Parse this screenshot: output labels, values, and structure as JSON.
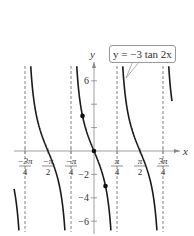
{
  "chart_data": {
    "type": "line",
    "title": "",
    "equation_label": "y = −3 tan 2x",
    "xlabel": "x",
    "ylabel": "y",
    "xlim": [
      -0.88,
      0.93
    ],
    "ylim": [
      -7.2,
      7.2
    ],
    "x_tick_labels": [
      {
        "num": "−3π",
        "den": "4",
        "value": -0.75
      },
      {
        "num": "−π",
        "den": "2",
        "value": -0.5
      },
      {
        "num": "−π",
        "den": "4",
        "value": -0.25
      },
      {
        "num": "π",
        "den": "4",
        "value": 0.25
      },
      {
        "num": "π",
        "den": "2",
        "value": 0.5
      },
      {
        "num": "3π",
        "den": "4",
        "value": 0.75
      }
    ],
    "x_tick_units": "multiples of π",
    "y_ticks": [
      -6,
      -4,
      -2,
      2,
      4,
      6
    ],
    "y_tick_labels": [
      "−6",
      "−4",
      "−2",
      "6"
    ],
    "asymptotes_x_pi": [
      -0.75,
      -0.25,
      0.25,
      0.75
    ],
    "series": [
      {
        "name": "y = −3 tan 2x",
        "function": "-3*tan(2x)",
        "color": "#1a1a1a"
      }
    ],
    "key_points": [
      {
        "x": "−π/8",
        "y": 3
      },
      {
        "x": "0",
        "y": 0
      },
      {
        "x": "π/8",
        "y": -3
      }
    ],
    "grid": false,
    "legend": "callout near top right"
  }
}
